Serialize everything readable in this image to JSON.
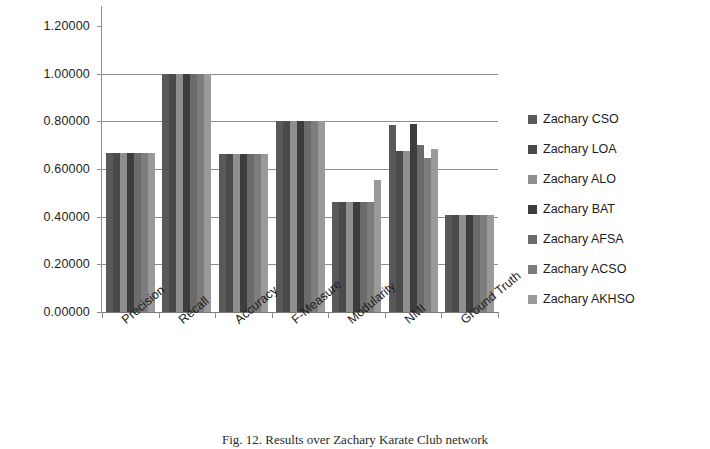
{
  "chart_data": {
    "type": "bar",
    "title": "",
    "subtitle": "",
    "xlabel": "",
    "ylabel": "",
    "ylim": [
      0,
      1.2
    ],
    "ytick_labels": [
      "1.20000",
      "1.00000",
      "0.80000",
      "0.60000",
      "0.40000",
      "0.20000",
      "0.00000"
    ],
    "ytick_values": [
      1.2,
      1.0,
      0.8,
      0.6,
      0.4,
      0.2,
      0.0
    ],
    "grid": true,
    "legend_position": "right",
    "categories": [
      "Precision",
      "Recall",
      "Accuracy",
      "F-Measure",
      "Modularity",
      "NMI",
      "Ground Truth"
    ],
    "series": [
      {
        "name": "Zachary CSO",
        "color": "#595959",
        "values": [
          0.667,
          1.0,
          0.665,
          0.8,
          0.46,
          0.785,
          0.408
        ]
      },
      {
        "name": "Zachary LOA",
        "color": "#4a4a4a",
        "values": [
          0.667,
          1.0,
          0.665,
          0.8,
          0.46,
          0.675,
          0.408
        ]
      },
      {
        "name": "Zachary ALO",
        "color": "#8f8f8f",
        "values": [
          0.667,
          1.0,
          0.665,
          0.8,
          0.46,
          0.675,
          0.408
        ]
      },
      {
        "name": "Zachary BAT",
        "color": "#3d3d3d",
        "values": [
          0.667,
          1.0,
          0.665,
          0.8,
          0.46,
          0.79,
          0.408
        ]
      },
      {
        "name": "Zachary AFSA",
        "color": "#6b6b6b",
        "values": [
          0.667,
          1.0,
          0.665,
          0.8,
          0.46,
          0.7,
          0.408
        ]
      },
      {
        "name": "Zachary ACSO",
        "color": "#7d7d7d",
        "values": [
          0.667,
          1.0,
          0.665,
          0.8,
          0.46,
          0.645,
          0.408
        ]
      },
      {
        "name": "Zachary AKHSO",
        "color": "#9a9a9a",
        "values": [
          0.667,
          1.0,
          0.665,
          0.8,
          0.555,
          0.685,
          0.408
        ]
      }
    ]
  },
  "legend": {
    "items": [
      {
        "label": "Zachary CSO"
      },
      {
        "label": "Zachary LOA"
      },
      {
        "label": "Zachary ALO"
      },
      {
        "label": "Zachary BAT"
      },
      {
        "label": "Zachary AFSA"
      },
      {
        "label": "Zachary ACSO"
      },
      {
        "label": "Zachary AKHSO"
      }
    ]
  },
  "caption": {
    "text": "Fig. 12.  Results over Zachary Karate Club network"
  }
}
